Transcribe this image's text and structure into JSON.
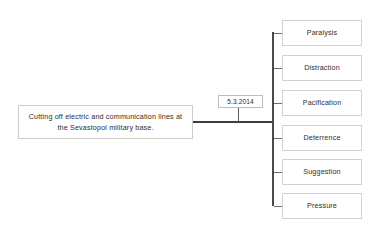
{
  "diagram": {
    "type": "tree",
    "source": {
      "label": "Cutting off electric and communication lines at the Sevastopol military base."
    },
    "date_marker": {
      "label": "5.3.2014"
    },
    "effects": [
      {
        "label": "Paralysis"
      },
      {
        "label": "Distraction"
      },
      {
        "label": "Pacification"
      },
      {
        "label": "Deterrence"
      },
      {
        "label": "Suggestion"
      },
      {
        "label": "Pressure"
      }
    ],
    "colors": {
      "background": "#ffffff",
      "box_border": "#d2d2d2",
      "text": "#2e2e2e",
      "trunk_line": "#4a4a4a",
      "stub_line": "#6d6d6d"
    }
  }
}
